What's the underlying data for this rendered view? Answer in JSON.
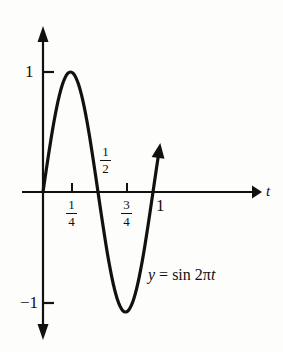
{
  "chart_data": {
    "type": "line",
    "title": "",
    "equation_label": "y = sin 2πt",
    "equation_parts": {
      "lhs": "y",
      "equals": "=",
      "fn": "sin",
      "coefficient": "2",
      "pi": "π",
      "variable": "t"
    },
    "function": "y = sin(2*pi*t)",
    "xlabel": "t",
    "ylabel": "",
    "xlim": [
      -0.12,
      1.35
    ],
    "ylim": [
      -1.45,
      1.45
    ],
    "grid": false,
    "legend": null,
    "x_ticks": [
      {
        "value": 0.25,
        "label": "1/4",
        "numerator": "1",
        "denominator": "4",
        "is_fraction": true
      },
      {
        "value": 0.75,
        "label": "3/4",
        "numerator": "3",
        "denominator": "4",
        "is_fraction": true
      },
      {
        "value": 1.0,
        "label": "1",
        "is_fraction": false
      }
    ],
    "x_annotations": [
      {
        "value": 0.5,
        "label": "1/2",
        "numerator": "1",
        "denominator": "2",
        "is_fraction": true,
        "placement": "above-axis"
      }
    ],
    "y_ticks": [
      {
        "value": 1,
        "label": "1"
      },
      {
        "value": -1,
        "label": "−1"
      }
    ],
    "key_points": [
      {
        "t": 0.0,
        "y": 0.0,
        "kind": "zero-crossing"
      },
      {
        "t": 0.25,
        "y": 1.0,
        "kind": "maximum"
      },
      {
        "t": 0.5,
        "y": 0.0,
        "kind": "zero-crossing"
      },
      {
        "t": 0.75,
        "y": -1.0,
        "kind": "minimum"
      },
      {
        "t": 1.0,
        "y": 0.0,
        "kind": "zero-crossing"
      }
    ],
    "series": [
      {
        "name": "y = sin 2πt",
        "x": [
          0,
          0.025,
          0.05,
          0.075,
          0.1,
          0.125,
          0.15,
          0.175,
          0.2,
          0.225,
          0.25,
          0.275,
          0.3,
          0.325,
          0.35,
          0.375,
          0.4,
          0.425,
          0.45,
          0.475,
          0.5,
          0.525,
          0.55,
          0.575,
          0.6,
          0.625,
          0.65,
          0.675,
          0.7,
          0.725,
          0.75,
          0.775,
          0.8,
          0.825,
          0.85,
          0.875,
          0.9,
          0.925,
          0.95,
          0.975,
          1.0,
          1.01,
          1.02,
          1.03,
          1.04,
          1.05
        ],
        "values": [
          0,
          0.156,
          0.309,
          0.454,
          0.588,
          0.707,
          0.809,
          0.891,
          0.951,
          0.988,
          1.0,
          0.988,
          0.951,
          0.891,
          0.809,
          0.707,
          0.588,
          0.454,
          0.309,
          0.156,
          0.0,
          -0.156,
          -0.309,
          -0.454,
          -0.588,
          -0.707,
          -0.809,
          -0.891,
          -0.951,
          -0.988,
          -1.0,
          -0.988,
          -0.951,
          -0.891,
          -0.809,
          -0.707,
          -0.588,
          -0.454,
          -0.309,
          -0.156,
          0.0,
          0.063,
          0.125,
          0.187,
          0.249,
          0.309
        ],
        "color": "#111111",
        "linewidth": 3.2,
        "arrow_end": true
      }
    ],
    "axes": {
      "x_axis_arrow": true,
      "y_axis_arrow_up": true,
      "y_axis_arrow_down": true,
      "color": "#111111"
    }
  },
  "figure": {
    "background": "#fdfdfb",
    "ink": "#111111"
  }
}
